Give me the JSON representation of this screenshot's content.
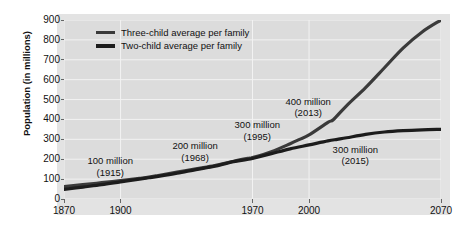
{
  "chart_data": {
    "type": "line",
    "title": "",
    "xlabel": "",
    "ylabel": "Population (in millions)",
    "xlim": [
      1870,
      2070
    ],
    "ylim": [
      0,
      900
    ],
    "grid": true,
    "legend_position": "top-left",
    "x_ticks": [
      1870,
      1900,
      1970,
      2000,
      2070
    ],
    "x_tick_labels": [
      "1870",
      "1900",
      "1970",
      "2000",
      "2070"
    ],
    "y_ticks": [
      0,
      100,
      200,
      300,
      400,
      500,
      600,
      700,
      800,
      900
    ],
    "y_tick_labels": [
      "0",
      "100",
      "200",
      "300",
      "400",
      "500",
      "600",
      "700",
      "800",
      "900"
    ],
    "series": [
      {
        "name": "Three-child average per family",
        "color": "#3a3a3a",
        "x": [
          1870,
          1880,
          1890,
          1900,
          1910,
          1915,
          1920,
          1930,
          1940,
          1950,
          1960,
          1968,
          1970,
          1980,
          1990,
          1995,
          2000,
          2010,
          2013,
          2020,
          2030,
          2040,
          2050,
          2060,
          2070
        ],
        "y": [
          62,
          72,
          82,
          93,
          104,
          110,
          118,
          135,
          152,
          168,
          190,
          205,
          208,
          238,
          278,
          300,
          322,
          385,
          400,
          470,
          560,
          660,
          760,
          840,
          900
        ]
      },
      {
        "name": "Two-child average per family",
        "color": "#1c1c1c",
        "x": [
          1870,
          1880,
          1890,
          1900,
          1910,
          1915,
          1920,
          1930,
          1940,
          1950,
          1960,
          1968,
          1970,
          1980,
          1990,
          2000,
          2010,
          2015,
          2020,
          2030,
          2040,
          2050,
          2060,
          2070
        ],
        "y": [
          48,
          60,
          72,
          86,
          100,
          107,
          114,
          130,
          148,
          165,
          188,
          200,
          204,
          228,
          252,
          272,
          292,
          300,
          308,
          325,
          337,
          344,
          348,
          350
        ]
      }
    ],
    "annotations": [
      {
        "name": "100-million-1915",
        "value": "100 million",
        "year": "(1915)",
        "x": 1900,
        "y": 190
      },
      {
        "name": "200-million-1968",
        "value": "200 million",
        "year": "(1968)",
        "x": 1945,
        "y": 265
      },
      {
        "name": "300-million-1995",
        "value": "300 million",
        "year": "(1995)",
        "x": 1978,
        "y": 370
      },
      {
        "name": "400-million-2013",
        "value": "400 million",
        "year": "(2013)",
        "x": 2005,
        "y": 490
      },
      {
        "name": "300-million-2015",
        "value": "300 million",
        "year": "(2015)",
        "x": 2030,
        "y": 248
      }
    ],
    "colors": {
      "figure_background": "#e3e3e3",
      "plot_background": "#dcdcdc",
      "gridline": "#f2f2f2",
      "text": "#111111",
      "three_child_line": "#3a3a3a",
      "two_child_line": "#1c1c1c"
    }
  },
  "legend": {
    "items": [
      {
        "label": "Three-child average per family",
        "swatch": "line-swatch-three-child"
      },
      {
        "label": "Two-child average per family",
        "swatch": "line-swatch-two-child"
      }
    ]
  },
  "axes": {
    "y_title": "Population (in millions)"
  }
}
